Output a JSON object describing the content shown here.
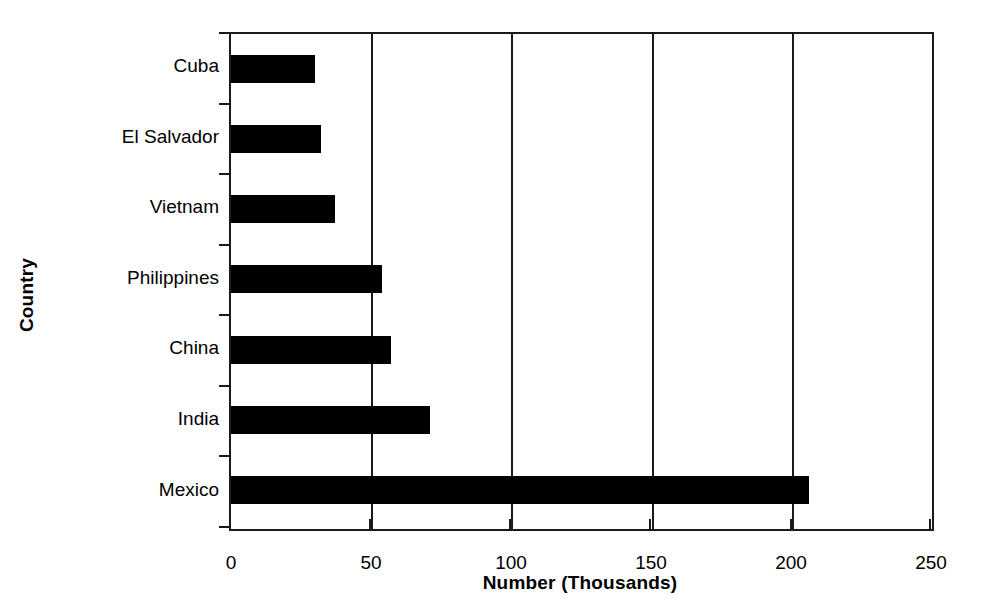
{
  "chart_data": {
    "type": "bar",
    "orientation": "horizontal",
    "title": "",
    "xlabel": "Number (Thousands)",
    "ylabel": "Country",
    "xlim": [
      0,
      250
    ],
    "xticks": [
      0,
      50,
      100,
      150,
      200,
      250
    ],
    "xtick_labels": [
      "0",
      "50",
      "100",
      "150",
      "200",
      "250"
    ],
    "grid": "vertical",
    "legend": "none",
    "bar_color": "#000000",
    "axis_color": "#1a1a1a",
    "categories": [
      "Cuba",
      "El Salvador",
      "Vietnam",
      "Philippines",
      "China",
      "India",
      "Mexico"
    ],
    "values": [
      30,
      32,
      37,
      54,
      57,
      71,
      206
    ],
    "points": [
      {
        "category": "Cuba",
        "value": 30
      },
      {
        "category": "El Salvador",
        "value": 32
      },
      {
        "category": "Vietnam",
        "value": 37
      },
      {
        "category": "Philippines",
        "value": 54
      },
      {
        "category": "China",
        "value": 57
      },
      {
        "category": "India",
        "value": 71
      },
      {
        "category": "Mexico",
        "value": 206
      }
    ]
  }
}
